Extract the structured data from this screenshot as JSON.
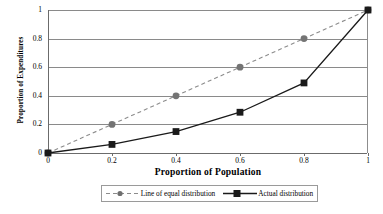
{
  "chart_data": {
    "type": "line",
    "title": "",
    "xlabel": "Proportion of Population",
    "ylabel": "Proportion of Expenditures",
    "xlim": [
      0,
      1
    ],
    "ylim": [
      0,
      1
    ],
    "xticks": [
      "0",
      "0.2",
      "0.4",
      "0.6",
      "0.8",
      "1"
    ],
    "yticks": [
      "0",
      "0.2",
      "0.4",
      "0.6",
      "0.8",
      "1"
    ],
    "xtick_values": [
      0,
      0.2,
      0.4,
      0.6,
      0.8,
      1
    ],
    "ytick_values": [
      0,
      0.2,
      0.4,
      0.6,
      0.8,
      1
    ],
    "grid": "horizontal",
    "legend_position": "bottom",
    "x": [
      0,
      0.2,
      0.4,
      0.6,
      0.8,
      1
    ],
    "series": [
      {
        "name": "Line of equal distribution",
        "values": [
          0,
          0.2,
          0.4,
          0.6,
          0.8,
          1
        ],
        "color": "#8c8c8c",
        "marker": "circle",
        "linestyle": "dashed"
      },
      {
        "name": "Actual distribution",
        "values": [
          0,
          0.06,
          0.15,
          0.285,
          0.49,
          1
        ],
        "color": "#1a1a1a",
        "marker": "square",
        "linestyle": "solid"
      }
    ]
  },
  "legend": {
    "entries": [
      {
        "label": "Line of equal distribution"
      },
      {
        "label": "Actual distribution"
      }
    ]
  },
  "colors": {
    "gridline": "#8a8a8a",
    "axis": "#6b6b6b",
    "equal_line": "#8c8c8c",
    "actual_line": "#1a1a1a",
    "background": "#ffffff"
  }
}
